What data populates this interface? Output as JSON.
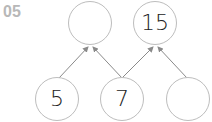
{
  "problem": {
    "number": "05"
  },
  "diagram": {
    "top_nodes": [
      {
        "value": ""
      },
      {
        "value": "15"
      }
    ],
    "bottom_nodes": [
      {
        "value": "5"
      },
      {
        "value": "7"
      },
      {
        "value": ""
      }
    ],
    "colors": {
      "circle_stroke": "#bdbdbd",
      "arrow": "#8a8a8a",
      "label": "#b8b8b8",
      "text": "#222222"
    }
  }
}
